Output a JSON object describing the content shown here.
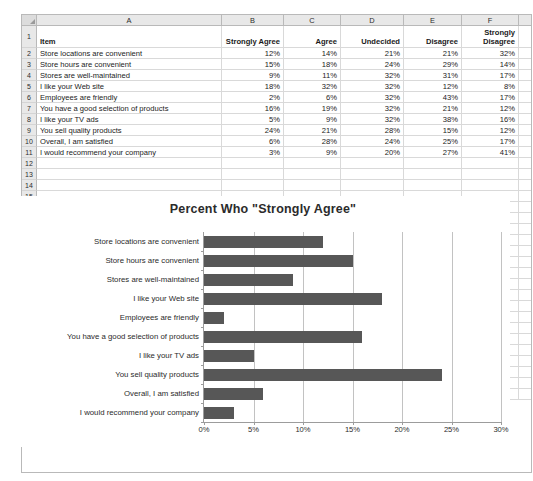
{
  "spreadsheet": {
    "column_headers": [
      "A",
      "B",
      "C",
      "D",
      "E",
      "F"
    ],
    "row_numbers": [
      "1",
      "2",
      "3",
      "4",
      "5",
      "6",
      "7",
      "8",
      "9",
      "10",
      "11",
      "12",
      "13",
      "14",
      "15",
      "16",
      "17",
      "18",
      "19",
      "20",
      "21",
      "22",
      "23",
      "24",
      "25",
      "26",
      "27",
      "28",
      "29",
      "30",
      "31",
      "32",
      "33"
    ],
    "header_row": {
      "item": "Item",
      "strongly_agree": "Strongly Agree",
      "agree": "Agree",
      "undecided": "Undecided",
      "disagree": "Disagree",
      "strongly_disagree_line1": "Strongly",
      "strongly_disagree_line2": "Disagree"
    },
    "rows": [
      {
        "num": "2",
        "item": "Store locations are convenient",
        "strongly_agree": "12%",
        "agree": "14%",
        "undecided": "21%",
        "disagree": "21%",
        "strongly_disagree": "32%"
      },
      {
        "num": "3",
        "item": "Store hours are convenient",
        "strongly_agree": "15%",
        "agree": "18%",
        "undecided": "24%",
        "disagree": "29%",
        "strongly_disagree": "14%"
      },
      {
        "num": "4",
        "item": "Stores are well-maintained",
        "strongly_agree": "9%",
        "agree": "11%",
        "undecided": "32%",
        "disagree": "31%",
        "strongly_disagree": "17%"
      },
      {
        "num": "5",
        "item": "I like your Web site",
        "strongly_agree": "18%",
        "agree": "32%",
        "undecided": "32%",
        "disagree": "12%",
        "strongly_disagree": "8%"
      },
      {
        "num": "6",
        "item": "Employees are friendly",
        "strongly_agree": "2%",
        "agree": "6%",
        "undecided": "32%",
        "disagree": "43%",
        "strongly_disagree": "17%"
      },
      {
        "num": "7",
        "item": "You have a good selection of products",
        "strongly_agree": "16%",
        "agree": "19%",
        "undecided": "32%",
        "disagree": "21%",
        "strongly_disagree": "12%"
      },
      {
        "num": "8",
        "item": "I like your TV ads",
        "strongly_agree": "5%",
        "agree": "9%",
        "undecided": "32%",
        "disagree": "38%",
        "strongly_disagree": "16%"
      },
      {
        "num": "9",
        "item": "You sell quality products",
        "strongly_agree": "24%",
        "agree": "21%",
        "undecided": "28%",
        "disagree": "15%",
        "strongly_disagree": "12%"
      },
      {
        "num": "10",
        "item": "Overall, I am satisfied",
        "strongly_agree": "6%",
        "agree": "28%",
        "undecided": "24%",
        "disagree": "25%",
        "strongly_disagree": "17%"
      },
      {
        "num": "11",
        "item": "I would recommend your company",
        "strongly_agree": "3%",
        "agree": "9%",
        "undecided": "20%",
        "disagree": "27%",
        "strongly_disagree": "41%"
      }
    ],
    "empty_row_numbers": [
      "12",
      "13",
      "14",
      "15",
      "16",
      "17",
      "18",
      "19",
      "20",
      "21",
      "22",
      "23",
      "24",
      "25",
      "26",
      "27",
      "28",
      "29",
      "30",
      "31",
      "32",
      "33"
    ]
  },
  "chart_data": {
    "type": "bar",
    "orientation": "horizontal",
    "title": "Percent  Who \"Strongly Agree\"",
    "xlabel": "",
    "ylabel": "",
    "categories": [
      "Store locations are convenient",
      "Store hours are convenient",
      "Stores are well-maintained",
      "I like your Web site",
      "Employees are friendly",
      "You have a good selection of products",
      "I like your TV ads",
      "You sell quality products",
      "Overall, I am satisfied",
      "I would recommend your company"
    ],
    "values": [
      12,
      15,
      9,
      18,
      2,
      16,
      5,
      24,
      6,
      3
    ],
    "xlim": [
      0,
      30
    ],
    "xticks": [
      0,
      5,
      10,
      15,
      20,
      25,
      30
    ],
    "xtick_labels": [
      "0%",
      "5%",
      "10%",
      "15%",
      "20%",
      "25%",
      "30%"
    ],
    "grid": "vertical",
    "legend": "none",
    "bar_color": "#575757"
  },
  "caption": {
    "text": ""
  }
}
